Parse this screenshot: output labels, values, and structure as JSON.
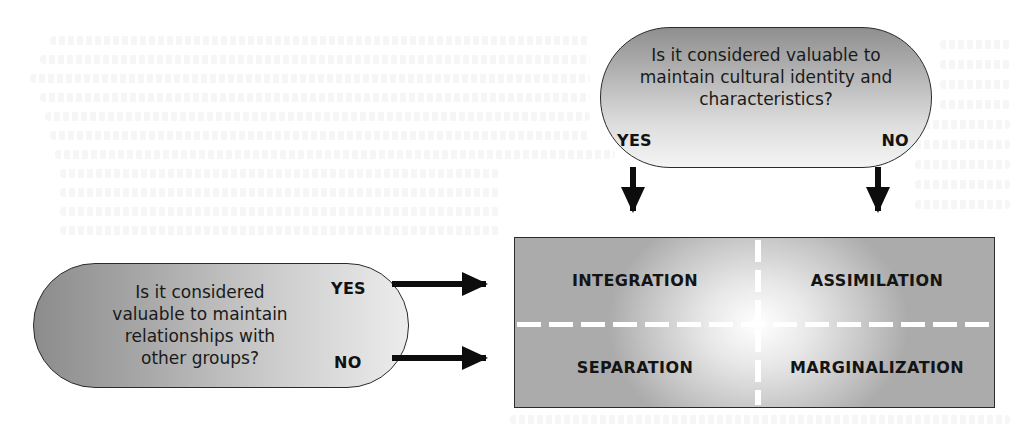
{
  "diagram": {
    "top_question": {
      "lines": [
        "Is it considered valuable to",
        "maintain cultural identity and",
        "characteristics?"
      ],
      "yes_label": "YES",
      "no_label": "NO"
    },
    "left_question": {
      "lines": [
        "Is it considered",
        "valuable to maintain",
        "relationships with",
        "other groups?"
      ],
      "yes_label": "YES",
      "no_label": "NO"
    },
    "outcomes": {
      "yes_yes": "INTEGRATION",
      "no_yes": "ASSIMILATION",
      "yes_no": "SEPARATION",
      "no_no": "MARGINALIZATION"
    },
    "colors": {
      "outline": "#2b2b2b",
      "arrow": "#0d0d0d",
      "fill_dark": "#8c8c8c",
      "fill_light": "#f4f4f4",
      "divider": "#ffffff"
    }
  }
}
